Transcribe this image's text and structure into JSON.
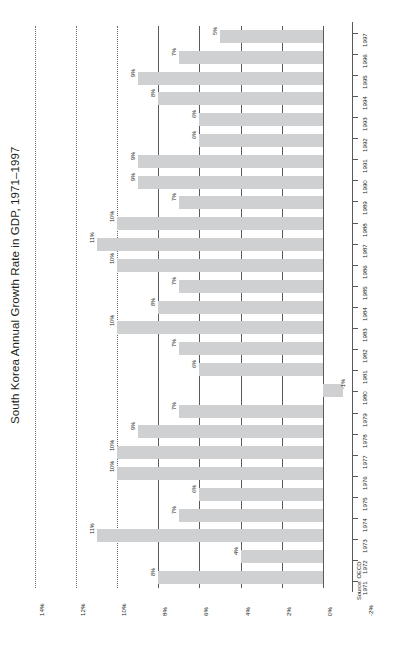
{
  "chart": {
    "title": "South Korea Annual Growth Rate in GDP, 1971–1997",
    "source": "Source: OECD"
  },
  "chart_data": {
    "type": "bar",
    "orientation": "horizontal",
    "title": "South Korea Annual Growth Rate in GDP, 1971–1997",
    "xlabel": "",
    "ylabel": "",
    "xlim": [
      -4,
      14
    ],
    "grid": true,
    "legend": "none",
    "source": "Source: OECD",
    "value_ticks": [
      "14%",
      "12%",
      "10%",
      "8%",
      "6%",
      "4%",
      "2%",
      "0%",
      "-2%",
      "-4%"
    ],
    "value_tick_numbers": [
      14,
      12,
      10,
      8,
      6,
      4,
      2,
      0,
      -2,
      -4
    ],
    "categories": [
      "1997",
      "1996",
      "1995",
      "1994",
      "1993",
      "1992",
      "1991",
      "1990",
      "1989",
      "1988",
      "1987",
      "1986",
      "1985",
      "1984",
      "1983",
      "1982",
      "1981",
      "1980",
      "1979",
      "1978",
      "1977",
      "1976",
      "1975",
      "1974",
      "1973",
      "1972",
      "1971"
    ],
    "values": [
      5,
      7,
      9,
      8,
      6,
      6,
      9,
      9,
      7,
      10,
      11,
      10,
      7,
      8,
      10,
      7,
      6,
      -1,
      7,
      9,
      10,
      10,
      6,
      7,
      11,
      4,
      8
    ],
    "data_labels": [
      "5%",
      "7%",
      "9%",
      "8%",
      "6%",
      "6%",
      "9%",
      "9%",
      "7%",
      "10%",
      "11%",
      "10%",
      "7%",
      "8%",
      "10%",
      "7%",
      "6%",
      "-1%",
      "7%",
      "9%",
      "10%",
      "10%",
      "6%",
      "7%",
      "11%",
      "4%",
      "8%"
    ],
    "bar_color": "#cfd0d2"
  }
}
